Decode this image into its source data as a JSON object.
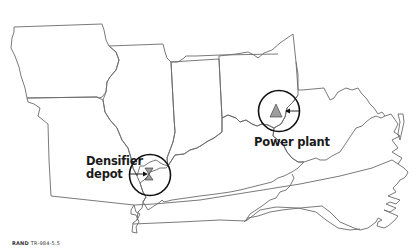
{
  "map": {
    "region": "Midwest and Mid-Atlantic United States",
    "line_color": "#6b6b6b",
    "marker_ring_color": "#111111",
    "marker_fill_color": "#9e9e9e"
  },
  "markers": [
    {
      "id": "densifier-depot",
      "label_line1": "Densifier",
      "label_line2": "depot",
      "symbol": "hourglass-icon"
    },
    {
      "id": "power-plant",
      "label": "Power plant",
      "symbol": "triangle-icon"
    }
  ],
  "credit": {
    "org": "RAND",
    "code": "TR-984-5.5"
  }
}
